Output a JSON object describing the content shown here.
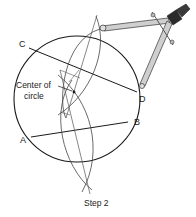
{
  "diagram": {
    "caption": "Step 2",
    "annotation": {
      "line1": "Center of",
      "line2": "circle"
    },
    "points": {
      "a": "A",
      "b": "B",
      "c": "C",
      "d": "D"
    },
    "elements": [
      "circle",
      "chord-cd",
      "chord-ab",
      "bisector-arcs-cd",
      "bisector-arcs-ab",
      "perpendicular-bisector-cd",
      "perpendicular-bisector-ab",
      "compass"
    ],
    "colors": {
      "line": "#1a1a1a",
      "construction": "#555555",
      "compass_body": "#c8c8c8",
      "compass_handle": "#2b2b2b"
    }
  }
}
